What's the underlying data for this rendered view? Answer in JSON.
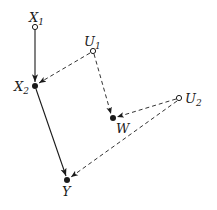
{
  "diagram": {
    "type": "causal-graph",
    "nodes": [
      {
        "id": "X1",
        "base": "X",
        "sub": "1",
        "kind": "observed-open",
        "x": 35,
        "y": 27
      },
      {
        "id": "U1",
        "base": "U",
        "sub": "1",
        "kind": "latent-open",
        "x": 93,
        "y": 51
      },
      {
        "id": "X2",
        "base": "X",
        "sub": "2",
        "kind": "filled",
        "x": 35,
        "y": 86
      },
      {
        "id": "W",
        "base": "W",
        "sub": "",
        "kind": "filled",
        "x": 113,
        "y": 118
      },
      {
        "id": "U2",
        "base": "U",
        "sub": "2",
        "kind": "latent-open",
        "x": 179,
        "y": 98
      },
      {
        "id": "Y",
        "base": "Y",
        "sub": "",
        "kind": "filled",
        "x": 67,
        "y": 180
      }
    ],
    "edges": [
      {
        "from": "X1",
        "to": "X2",
        "style": "solid"
      },
      {
        "from": "X2",
        "to": "Y",
        "style": "solid"
      },
      {
        "from": "U1",
        "to": "X2",
        "style": "dashed"
      },
      {
        "from": "U1",
        "to": "W",
        "style": "dashed"
      },
      {
        "from": "U2",
        "to": "W",
        "style": "dashed"
      },
      {
        "from": "U2",
        "to": "Y",
        "style": "dashed"
      }
    ],
    "labels": {
      "X1": {
        "base": "X",
        "sub": "1"
      },
      "U1": {
        "base": "U",
        "sub": "1"
      },
      "X2": {
        "base": "X",
        "sub": "2"
      },
      "W": {
        "base": "W"
      },
      "U2": {
        "base": "U",
        "sub": "2"
      },
      "Y": {
        "base": "Y"
      }
    }
  }
}
